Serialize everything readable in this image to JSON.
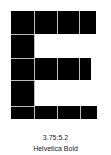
{
  "glyph": {
    "letter": "E",
    "color": "#000000",
    "grid_color": "#bdbdbd"
  },
  "caption": {
    "ratio": "3.75:5.2",
    "font_name": "Helvetica Bold"
  }
}
